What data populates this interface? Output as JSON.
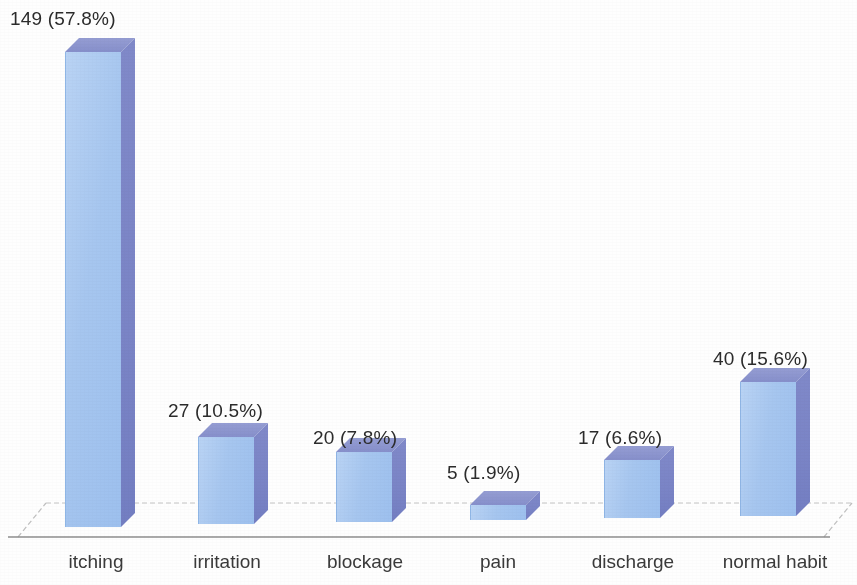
{
  "chart_data": {
    "type": "bar",
    "title": "",
    "subtitle": "",
    "xlabel": "",
    "ylabel": "",
    "grid": false,
    "legend": "none",
    "three_d": true,
    "total": 258,
    "categories": [
      "itching",
      "irritation",
      "blockage",
      "pain",
      "discharge",
      "normal habit"
    ],
    "values": [
      149,
      27,
      20,
      5,
      17,
      40
    ],
    "percents": [
      "57.8%",
      "10.5%",
      "7.8%",
      "1.9%",
      "6.6%",
      "15.6%"
    ],
    "data_labels": [
      "149  (57.8%)",
      "27 (10.5%)",
      "20 (7.8%)",
      "5 (1.9%)",
      "17 (6.6%)",
      "40 (15.6%)"
    ],
    "ylim": [
      0,
      160
    ]
  },
  "colors": {
    "bar_front": "#a6c6ef",
    "bar_side": "#7a84c6",
    "bar_top": "#868fcb",
    "floor_line": "#9a9a9a",
    "floor_back_line": "#c9c9c9",
    "label_text": "#2b2b2b",
    "category_text": "#3a3a3a",
    "background": "#ffffff"
  },
  "bars": [
    {
      "name": "itching",
      "label": "149  (57.8%)",
      "label_x": 10,
      "label_y": 8,
      "x": 65,
      "width": 56,
      "top": 52,
      "bottom": 527,
      "depth": 14,
      "cat_x": 36,
      "cat_w": 120
    },
    {
      "name": "irritation",
      "label": "27 (10.5%)",
      "label_x": 168,
      "label_y": 400,
      "x": 198,
      "width": 56,
      "top": 437,
      "bottom": 524,
      "depth": 14,
      "cat_x": 166,
      "cat_w": 122
    },
    {
      "name": "blockage",
      "label": "20 (7.8%)",
      "label_x": 313,
      "label_y": 427,
      "x": 336,
      "width": 56,
      "top": 452,
      "bottom": 522,
      "depth": 14,
      "cat_x": 303,
      "cat_w": 124
    },
    {
      "name": "pain",
      "label": "5 (1.9%)",
      "label_x": 447,
      "label_y": 462,
      "x": 470,
      "width": 56,
      "top": 505,
      "bottom": 520,
      "depth": 14,
      "cat_x": 437,
      "cat_w": 122
    },
    {
      "name": "discharge",
      "label": "17 (6.6%)",
      "label_x": 578,
      "label_y": 427,
      "x": 604,
      "width": 56,
      "top": 460,
      "bottom": 518,
      "depth": 14,
      "cat_x": 571,
      "cat_w": 124
    },
    {
      "name": "normal habit",
      "label": "40 (15.6%)",
      "label_x": 713,
      "label_y": 348,
      "x": 740,
      "width": 56,
      "top": 382,
      "bottom": 516,
      "depth": 14,
      "cat_x": 700,
      "cat_w": 150
    }
  ],
  "axis": {
    "front_left_x": 18,
    "front_right_x": 836,
    "front_y": 537,
    "back_left_x": 46,
    "back_right_x": 852,
    "back_y": 503
  }
}
